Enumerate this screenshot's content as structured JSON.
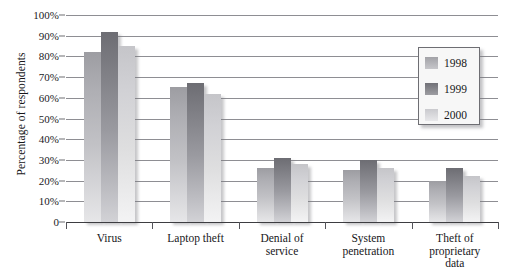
{
  "chart_data": {
    "type": "bar",
    "title": "",
    "xlabel": "",
    "ylabel": "Percentage of respondents",
    "ylim": [
      0,
      100
    ],
    "grid": true,
    "legend_position": "top-right",
    "categories": [
      "Virus",
      "Laptop theft",
      "Denial of service",
      "System penetration",
      "Theft of proprietary data"
    ],
    "category_lines": [
      [
        "Virus"
      ],
      [
        "Laptop theft"
      ],
      [
        "Denial of",
        "service"
      ],
      [
        "System",
        "penetration"
      ],
      [
        "Theft of",
        "proprietary",
        "data"
      ]
    ],
    "series": [
      {
        "name": "1998",
        "color": "#aeaeb3",
        "values": [
          82,
          65,
          26,
          25,
          20
        ]
      },
      {
        "name": "1999",
        "color": "#7e7e84",
        "values": [
          92,
          67,
          31,
          30,
          26
        ]
      },
      {
        "name": "2000",
        "color": "#d9d9dc",
        "values": [
          85,
          62,
          28,
          26,
          22
        ]
      }
    ],
    "y_ticks": [
      {
        "value": 100,
        "label": "100%"
      },
      {
        "value": 90,
        "label": "90%"
      },
      {
        "value": 80,
        "label": "80%"
      },
      {
        "value": 70,
        "label": "70%"
      },
      {
        "value": 60,
        "label": "60%"
      },
      {
        "value": 50,
        "label": "50%"
      },
      {
        "value": 40,
        "label": "40%"
      },
      {
        "value": 30,
        "label": "30%"
      },
      {
        "value": 20,
        "label": "20%"
      },
      {
        "value": 10,
        "label": "10%"
      },
      {
        "value": 0,
        "label": "0"
      }
    ]
  },
  "legend": {
    "items": [
      {
        "label": "1998"
      },
      {
        "label": "1999"
      },
      {
        "label": "2000"
      }
    ]
  },
  "axes": {
    "y_title": "Percentage of respondents"
  },
  "colors": {
    "gridline": "#8e8e93",
    "axis": "#3d3d41",
    "text": "#17171a",
    "legend_background": "#f7f7f7",
    "legend_border": "#6e6e73"
  }
}
